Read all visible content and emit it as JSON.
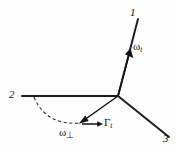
{
  "figure": {
    "type": "vector-diagram",
    "background_color": "#fdfdfd",
    "stroke_color": "#141414",
    "width": 176,
    "height": 152,
    "origin": {
      "x": 118,
      "y": 96
    },
    "axes": [
      {
        "id": "axis-1",
        "label": "1",
        "from": {
          "x": 118,
          "y": 96
        },
        "to": {
          "x": 138,
          "y": 19
        },
        "label_pos": {
          "x": 130,
          "y": 7
        }
      },
      {
        "id": "axis-2",
        "label": "2",
        "from": {
          "x": 118,
          "y": 96
        },
        "to": {
          "x": 22,
          "y": 96
        },
        "label_pos": {
          "x": 9,
          "y": 89
        }
      },
      {
        "id": "axis-3",
        "label": "3",
        "from": {
          "x": 118,
          "y": 96
        },
        "to": {
          "x": 169,
          "y": 137
        },
        "label_pos": {
          "x": 163,
          "y": 133
        }
      }
    ],
    "vectors": [
      {
        "id": "omega-parallel",
        "label": "ω",
        "subscript": "t",
        "label_pos": {
          "x": 133,
          "y": 41
        },
        "from": {
          "x": 118,
          "y": 96
        },
        "to": {
          "x": 129,
          "y": 53
        },
        "along_axis": "axis-1"
      },
      {
        "id": "omega-perpendicular",
        "label": "ω",
        "subscript": "⊥",
        "label_pos": {
          "x": 59,
          "y": 127
        },
        "from": {
          "x": 118,
          "y": 96
        },
        "to": {
          "x": 80,
          "y": 123
        }
      },
      {
        "id": "gamma-t",
        "label": "Γ",
        "subscript": "t",
        "label_pos": {
          "x": 104,
          "y": 117
        },
        "from": {
          "x": 82,
          "y": 124
        },
        "to": {
          "x": 102,
          "y": 124
        }
      }
    ],
    "arc": {
      "id": "rotation-arc",
      "style": "dashed",
      "from": {
        "x": 34,
        "y": 97
      },
      "to": {
        "x": 82,
        "y": 124
      },
      "control": {
        "x": 46,
        "y": 126
      }
    }
  }
}
